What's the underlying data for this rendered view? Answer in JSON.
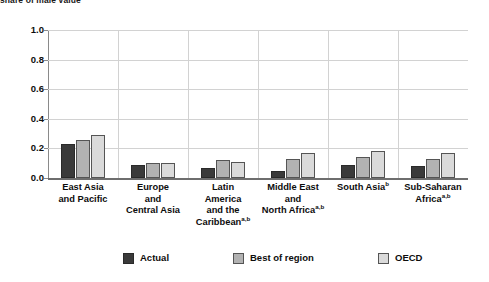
{
  "caption": {
    "text": "share of male value"
  },
  "chart_data": {
    "type": "bar",
    "title": "",
    "subtitle": "",
    "xlabel": "",
    "ylabel": "",
    "ylim": [
      0.0,
      1.0
    ],
    "ytick_labels": [
      "1.0",
      "0.8",
      "0.6",
      "0.4",
      "0.2",
      "0.0"
    ],
    "ytick_values": [
      1.0,
      0.8,
      0.6,
      0.4,
      0.2,
      0.0
    ],
    "grid": true,
    "legend_position": "bottom",
    "categories": [
      "East Asia and Pacific",
      "Europe and Central Asia",
      "Latin America and the Caribbean",
      "Middle East and North Africa",
      "South Asia",
      "Sub-Saharan Africa"
    ],
    "category_labels": [
      {
        "lines": [
          "East Asia",
          "and Pacific"
        ],
        "superscript": ""
      },
      {
        "lines": [
          "Europe",
          "and",
          "Central Asia"
        ],
        "superscript": ""
      },
      {
        "lines": [
          "Latin",
          "America",
          "and the",
          "Caribbean"
        ],
        "superscript": "a,b"
      },
      {
        "lines": [
          "Middle East",
          "and",
          "North Africa"
        ],
        "superscript": "a,b"
      },
      {
        "lines": [
          "South Asia"
        ],
        "superscript": "b"
      },
      {
        "lines": [
          "Sub-Saharan",
          "Africa"
        ],
        "superscript": "a,b"
      }
    ],
    "series": [
      {
        "name": "Actual",
        "color": "#3a3a3a",
        "values": [
          0.23,
          0.09,
          0.07,
          0.05,
          0.09,
          0.08
        ]
      },
      {
        "name": "Best of region",
        "color": "#b2b2b2",
        "values": [
          0.26,
          0.1,
          0.12,
          0.13,
          0.14,
          0.13
        ]
      },
      {
        "name": "OECD",
        "color": "#dadada",
        "values": [
          0.29,
          0.1,
          0.11,
          0.17,
          0.18,
          0.17
        ]
      }
    ]
  },
  "legend": {
    "items": [
      {
        "label": "Actual",
        "swatch": "actual"
      },
      {
        "label": "Best of region",
        "swatch": "best"
      },
      {
        "label": "OECD",
        "swatch": "oecd"
      }
    ]
  }
}
